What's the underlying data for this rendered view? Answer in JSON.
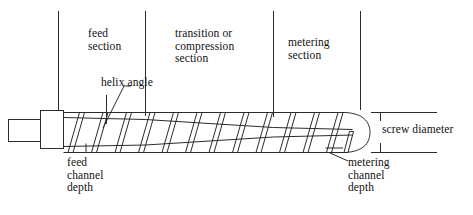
{
  "diagram": {
    "stroke_color": "#2b2b2b",
    "background_color": "#ffffff"
  },
  "labels": {
    "feed_section": "feed\nsection",
    "transition_section": "transition or\ncompression\nsection",
    "metering_section": "metering\nsection",
    "helix_angle": "helix angle",
    "feed_channel_depth": "feed\nchannel\ndepth",
    "metering_channel_depth": "metering\nchannel\ndepth",
    "screw_diameter": "screw diameter"
  },
  "geometry": {
    "divider_x": [
      58,
      145,
      273,
      360
    ],
    "divider_top_y": 11,
    "divider_bottom_y": 113,
    "shank": {
      "x": 8,
      "y": 119,
      "width": 32,
      "height": 22
    },
    "collar": {
      "x": 40,
      "y": 110,
      "width": 23,
      "height": 38
    },
    "envelope_top_y": 112,
    "envelope_bottom_y": 152,
    "core_start_top_y": 117,
    "core_start_bottom_y": 146,
    "core_end_top_y": 123,
    "core_end_bottom_y": 141,
    "flight_count": 12,
    "tip_x": 360
  }
}
